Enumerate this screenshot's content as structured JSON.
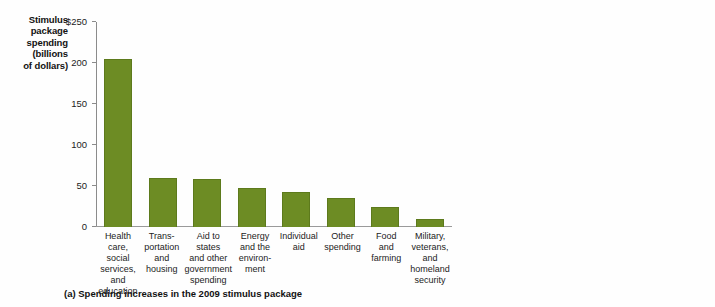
{
  "chart_data": [
    {
      "type": "bar",
      "panel": "a",
      "title": "",
      "caption": "(a) Spending increases in the 2009 stimulus package",
      "ylabel": "Stimulus package spending (billions of dollars)",
      "ylabel_lines": [
        "Stimulus",
        "package",
        "spending",
        "(billions",
        "of dollars)"
      ],
      "xlabel": "",
      "ylim": [
        0,
        250
      ],
      "yticks": [
        0,
        50,
        100,
        150,
        200,
        250
      ],
      "ytick_labels": [
        "0",
        "50",
        "100",
        "150",
        "200",
        "$250"
      ],
      "grid": false,
      "legend": "none",
      "bar_color": "#6d8c24",
      "categories": [
        "Health care, social services, and education",
        "Trans- portation and housing",
        "Aid to states and other government spending",
        "Energy and the environ- ment",
        "Individual aid",
        "Other spending",
        "Food and farming",
        "Military, veterans, and homeland security"
      ],
      "category_lines": [
        [
          "Health care,",
          "social services,",
          "and education"
        ],
        [
          "Trans-",
          "portation",
          "and",
          "housing"
        ],
        [
          "Aid to states",
          "and other",
          "government",
          "spending"
        ],
        [
          "Energy",
          "and the",
          "environ-",
          "ment"
        ],
        [
          "Individual",
          "aid"
        ],
        [
          "Other",
          "spending"
        ],
        [
          "Food",
          "and",
          "farming"
        ],
        [
          "Military,",
          "veterans,",
          "and",
          "homeland",
          "security"
        ]
      ],
      "values": [
        205,
        60,
        58,
        48,
        43,
        35,
        24,
        10
      ]
    },
    {
      "type": "bar",
      "panel": "b",
      "title": "",
      "caption": "(b) Tax cuts in the 2009 stimulus package",
      "ylabel": "Tax cuts (billions of dollars)",
      "ylabel_lines": [
        "Tax cuts",
        "(billions",
        "of dollars)"
      ],
      "xlabel": "",
      "ylim": [
        0,
        250
      ],
      "yticks": [
        0,
        50,
        100,
        150,
        200,
        250
      ],
      "ytick_labels": [
        "0",
        "50",
        "100",
        "150",
        "200",
        "$250"
      ],
      "grid": false,
      "legend": "none",
      "bar_color": "#6d8c24",
      "categories": [
        "Individual",
        "Infra- structure",
        "Energy",
        "Business"
      ],
      "category_lines": [
        [
          "Individual"
        ],
        [
          "Infra-",
          "structure"
        ],
        [
          "Energy"
        ],
        [
          "Business"
        ]
      ],
      "values": [
        235,
        25,
        18,
        5
      ]
    }
  ]
}
